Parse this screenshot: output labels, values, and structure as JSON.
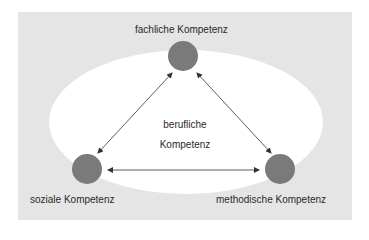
{
  "diagram": {
    "nodes": [
      {
        "id": "fachlich",
        "label": "fachliche Kompetenz"
      },
      {
        "id": "sozial",
        "label": "soziale Kompetenz"
      },
      {
        "id": "methodisch",
        "label": "methodische Kompetenz"
      }
    ],
    "center": {
      "line1": "berufliche",
      "line2": "Kompetenz"
    },
    "edges": [
      {
        "from": "fachlich",
        "to": "sozial",
        "type": "bidirectional"
      },
      {
        "from": "fachlich",
        "to": "methodisch",
        "type": "bidirectional"
      },
      {
        "from": "sozial",
        "to": "methodisch",
        "type": "bidirectional"
      }
    ],
    "colors": {
      "background": "#e5e5e5",
      "ellipse": "#ffffff",
      "node": "#7a7a7a",
      "line": "#333333"
    }
  }
}
